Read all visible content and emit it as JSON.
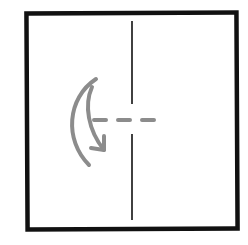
{
  "diagram": {
    "colors": {
      "outline": "#111111",
      "crease": "#111111",
      "fold_line": "#8c8c8c",
      "arrow": "#8c8c8c",
      "background": "#ffffff"
    },
    "icons": [
      "curved-fold-arrow-icon"
    ]
  }
}
